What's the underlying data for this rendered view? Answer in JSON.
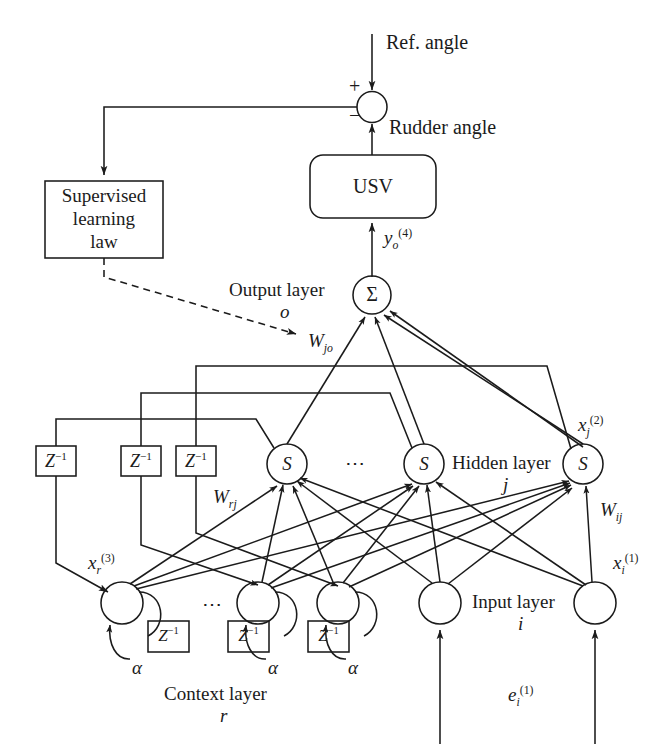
{
  "figure": {
    "type": "block-diagram"
  },
  "labels": {
    "ref_angle": "Ref. angle",
    "rudder_angle": "Rudder angle",
    "plus": "+",
    "minus": "−",
    "sum_symbol": "Σ",
    "usv": "USV",
    "supervised_line1": "Supervised",
    "supervised_line2": "learning",
    "supervised_line3": "law",
    "output_layer_name": "Output layer",
    "output_layer_index": "o",
    "hidden_layer_name": "Hidden layer",
    "hidden_layer_index": "j",
    "input_layer_name": "Input layer",
    "input_layer_index": "i",
    "context_layer_name": "Context layer",
    "context_layer_index": "r",
    "ellipsis": "⋯",
    "alpha": "α",
    "delay_block": "Z",
    "delay_exponent": "−1",
    "sigmoid_glyph": "S"
  },
  "signals": {
    "y_o_4": {
      "base": "y",
      "sub": "o",
      "sup": "(4)"
    },
    "x_j_2": {
      "base": "x",
      "sub": "j",
      "sup": "(2)"
    },
    "x_i_1": {
      "base": "x",
      "sub": "i",
      "sup": "(1)"
    },
    "x_r_3": {
      "base": "x",
      "sub": "r",
      "sup": "(3)"
    },
    "e_i_1": {
      "base": "e",
      "sub": "i",
      "sup": "(1)"
    }
  },
  "weights": {
    "w_jo": {
      "base": "W",
      "sub": "jo"
    },
    "w_ij": {
      "base": "W",
      "sub": "ij"
    },
    "w_rj": {
      "base": "W",
      "sub": "rj"
    }
  },
  "colors": {
    "stroke": "#1b1b1b",
    "background": "#ffffff",
    "text": "#1b1b1b"
  },
  "counts": {
    "delay_blocks_top": 3,
    "delay_blocks_context": 3,
    "hidden_nodes_shown": 3,
    "context_nodes_shown": 3,
    "input_nodes_shown": 2
  }
}
